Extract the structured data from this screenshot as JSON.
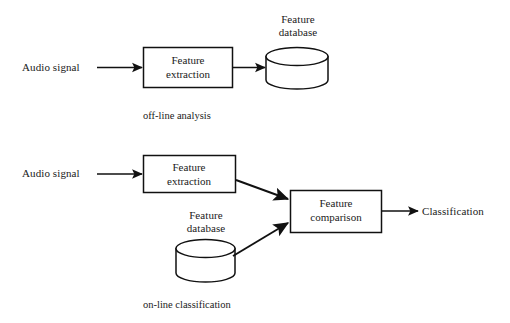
{
  "figure": {
    "kind": "block-diagram",
    "background_color": "#ffffff",
    "stroke_color": "#111111",
    "text_color": "#1a1a1a",
    "width": 510,
    "height": 323
  },
  "offline": {
    "caption": "off-line analysis",
    "input_label": "Audio signal",
    "process_box": {
      "line1": "Feature",
      "line2": "extraction"
    },
    "store_label": {
      "line1": "Feature",
      "line2": "database"
    }
  },
  "online": {
    "caption": "on-line classification",
    "input_label": "Audio signal",
    "extraction_box": {
      "line1": "Feature",
      "line2": "extraction"
    },
    "store_label": {
      "line1": "Feature",
      "line2": "database"
    },
    "comparison_box": {
      "line1": "Feature",
      "line2": "comparison"
    },
    "output_label": "Classification"
  },
  "icons": {
    "cylinder": "database-cylinder-icon",
    "arrow": "arrow-head-icon"
  }
}
